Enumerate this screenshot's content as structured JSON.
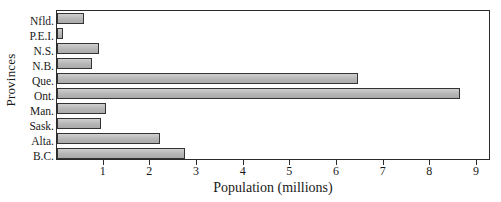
{
  "chart_data": {
    "type": "bar",
    "orientation": "horizontal",
    "title": "",
    "xlabel": "Population (millions)",
    "ylabel": "Provinces",
    "categories": [
      "Nfld.",
      "P.E.I.",
      "N.S.",
      "N.B.",
      "Que.",
      "Ont.",
      "Man.",
      "Sask.",
      "Alta.",
      "B.C."
    ],
    "values": [
      0.58,
      0.13,
      0.89,
      0.75,
      6.45,
      8.63,
      1.05,
      0.95,
      2.2,
      2.75
    ],
    "xlim": [
      0,
      9.3
    ],
    "ylim": [
      0,
      10
    ],
    "xticks": [
      1,
      2,
      3,
      4,
      5,
      6,
      7,
      8,
      9
    ],
    "xtick_labels": [
      "1",
      "2",
      "3",
      "4",
      "5",
      "6",
      "7",
      "8",
      "9"
    ],
    "grid": false,
    "legend": false,
    "legend_position": "none",
    "bar_fill_color": "#b9b9b9",
    "bar_edge_color": "#333333",
    "axis_color": "#2b2b2b",
    "background_color": "#ffffff"
  }
}
